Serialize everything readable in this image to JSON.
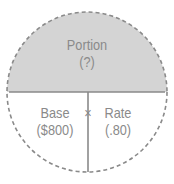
{
  "diagram": {
    "type": "portion-base-rate circle",
    "top": {
      "label": "Portion",
      "value": "(?)"
    },
    "bottom_left": {
      "label": "Base",
      "value": "($800)"
    },
    "bottom_right": {
      "label": "Rate",
      "value": "(.80)"
    },
    "operator": "×",
    "colors": {
      "top_fill": "#d4d4d4",
      "line": "#8a8a8a",
      "text": "#8a8a8a"
    }
  }
}
